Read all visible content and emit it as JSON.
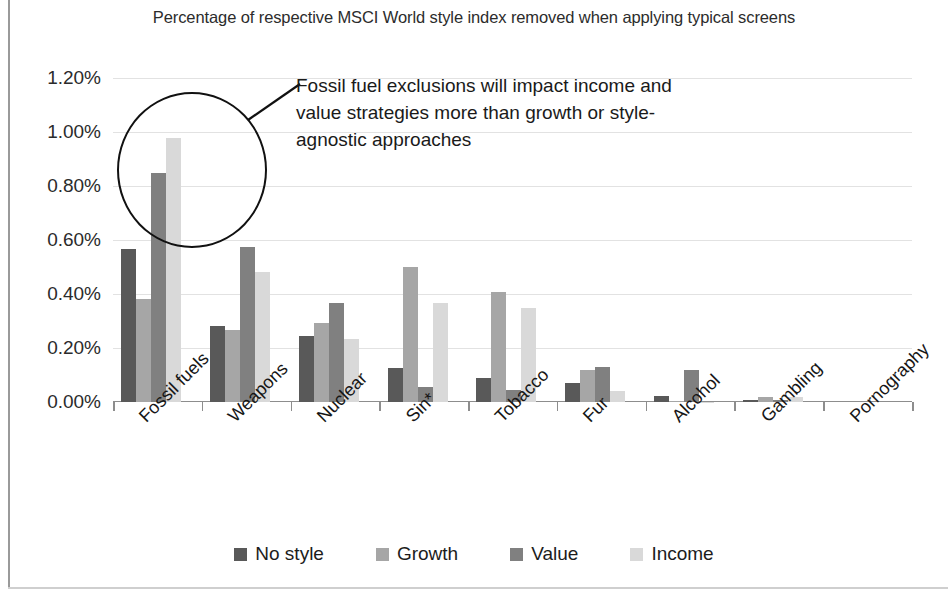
{
  "chart_data": {
    "type": "bar",
    "title": "Percentage of respective MSCI World style index removed when applying typical screens",
    "xlabel": "",
    "ylabel": "",
    "ylim": [
      0,
      0.012
    ],
    "grid": true,
    "legend_position": "bottom",
    "ytick_labels": [
      "1.20%",
      "1.00%",
      "0.80%",
      "0.60%",
      "0.40%",
      "0.20%",
      "0.00%"
    ],
    "ytick_values": [
      1.2,
      1.0,
      0.8,
      0.6,
      0.4,
      0.2,
      0.0
    ],
    "categories": [
      "Fossil fuels",
      "Weapons",
      "Nuclear",
      "Sin*",
      "Tobacco",
      "Fur",
      "Alcohol",
      "Gambling",
      "Pornography"
    ],
    "series": [
      {
        "name": "No style",
        "color": "#595959",
        "values": [
          0.565,
          0.28,
          0.243,
          0.125,
          0.088,
          0.07,
          0.022,
          0.006,
          0.0
        ]
      },
      {
        "name": "Growth",
        "color": "#a6a6a6",
        "values": [
          0.38,
          0.268,
          0.293,
          0.5,
          0.408,
          0.118,
          0.002,
          0.018,
          0.0
        ]
      },
      {
        "name": "Value",
        "color": "#808080",
        "values": [
          0.848,
          0.573,
          0.368,
          0.055,
          0.043,
          0.13,
          0.118,
          0.007,
          0.0
        ]
      },
      {
        "name": "Income",
        "color": "#d9d9d9",
        "values": [
          0.978,
          0.483,
          0.233,
          0.365,
          0.35,
          0.04,
          0.001,
          0.02,
          0.0
        ]
      }
    ],
    "annotations": [
      {
        "text": "Fossil fuel exclusions will impact income and value strategies more than growth or style-agnostic approaches",
        "target": "Fossil fuels"
      }
    ]
  },
  "legend": {
    "items": [
      {
        "label": "No style",
        "color": "#595959"
      },
      {
        "label": "Growth",
        "color": "#a6a6a6"
      },
      {
        "label": "Value",
        "color": "#808080"
      },
      {
        "label": "Income",
        "color": "#d9d9d9"
      }
    ]
  }
}
